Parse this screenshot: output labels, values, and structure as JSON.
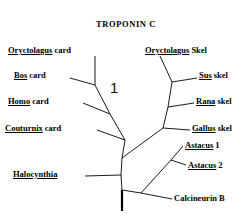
{
  "figure": {
    "title": "TROPONIN C",
    "scale_bar_label": "1",
    "background_color": "#ffffff",
    "line_color": "#000000"
  },
  "taxa": [
    {
      "id": "oryctolagus-card",
      "genus": "Oryctolagus",
      "epithet": "card",
      "side": "left"
    },
    {
      "id": "bos-card",
      "genus": "Bos",
      "epithet": "card",
      "side": "left"
    },
    {
      "id": "homo-card",
      "genus": "Homo",
      "epithet": "card",
      "side": "left"
    },
    {
      "id": "couturnix-card",
      "genus": "Couturnix",
      "epithet": "card",
      "side": "left"
    },
    {
      "id": "halocynthia",
      "genus": "Halocynthia",
      "epithet": "",
      "side": "left"
    },
    {
      "id": "oryctolagus-skel",
      "genus": "Oryctolagus",
      "epithet": "Skel",
      "side": "right"
    },
    {
      "id": "sus-skel",
      "genus": "Sus",
      "epithet": "skel",
      "side": "right"
    },
    {
      "id": "rana-skel",
      "genus": "Rana",
      "epithet": "skel",
      "side": "right"
    },
    {
      "id": "gallus-skel",
      "genus": "Gallus",
      "epithet": "skel",
      "side": "right"
    },
    {
      "id": "astacus-1",
      "genus": "Astacus",
      "epithet": "1",
      "side": "right"
    },
    {
      "id": "astacus-2",
      "genus": "Astacus",
      "epithet": "2",
      "side": "right"
    },
    {
      "id": "calcineurin-b",
      "genus": "Calcineurin",
      "epithet": "B",
      "side": "right",
      "underlined": false
    }
  ]
}
